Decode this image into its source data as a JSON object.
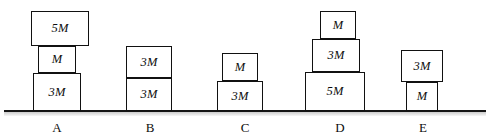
{
  "figure": {
    "ground_label": "ground-line",
    "line_color": "#111111",
    "block_fill": "#ffffff",
    "background": "#ffffff"
  },
  "stacks": [
    {
      "label": "A",
      "label_x": 57,
      "blocks": [
        {
          "mass": "5M",
          "x": 31,
          "y": 11,
          "w": 58,
          "h": 35
        },
        {
          "mass": "M",
          "x": 38,
          "y": 46,
          "w": 38,
          "h": 27
        },
        {
          "mass": "3M",
          "x": 33,
          "y": 73,
          "w": 48,
          "h": 38
        }
      ]
    },
    {
      "label": "B",
      "label_x": 150,
      "blocks": [
        {
          "mass": "3M",
          "x": 126,
          "y": 46,
          "w": 46,
          "h": 32
        },
        {
          "mass": "3M",
          "x": 126,
          "y": 78,
          "w": 46,
          "h": 33
        }
      ]
    },
    {
      "label": "C",
      "label_x": 245,
      "blocks": [
        {
          "mass": "M",
          "x": 222,
          "y": 53,
          "w": 36,
          "h": 28
        },
        {
          "mass": "3M",
          "x": 217,
          "y": 81,
          "w": 46,
          "h": 30
        }
      ]
    },
    {
      "label": "D",
      "label_x": 340,
      "blocks": [
        {
          "mass": "M",
          "x": 320,
          "y": 11,
          "w": 36,
          "h": 28
        },
        {
          "mass": "3M",
          "x": 312,
          "y": 39,
          "w": 48,
          "h": 33
        },
        {
          "mass": "5M",
          "x": 305,
          "y": 72,
          "w": 60,
          "h": 39
        }
      ]
    },
    {
      "label": "E",
      "label_x": 423,
      "blocks": [
        {
          "mass": "3M",
          "x": 401,
          "y": 50,
          "w": 42,
          "h": 32
        },
        {
          "mass": "M",
          "x": 406,
          "y": 82,
          "w": 32,
          "h": 29
        }
      ]
    }
  ]
}
